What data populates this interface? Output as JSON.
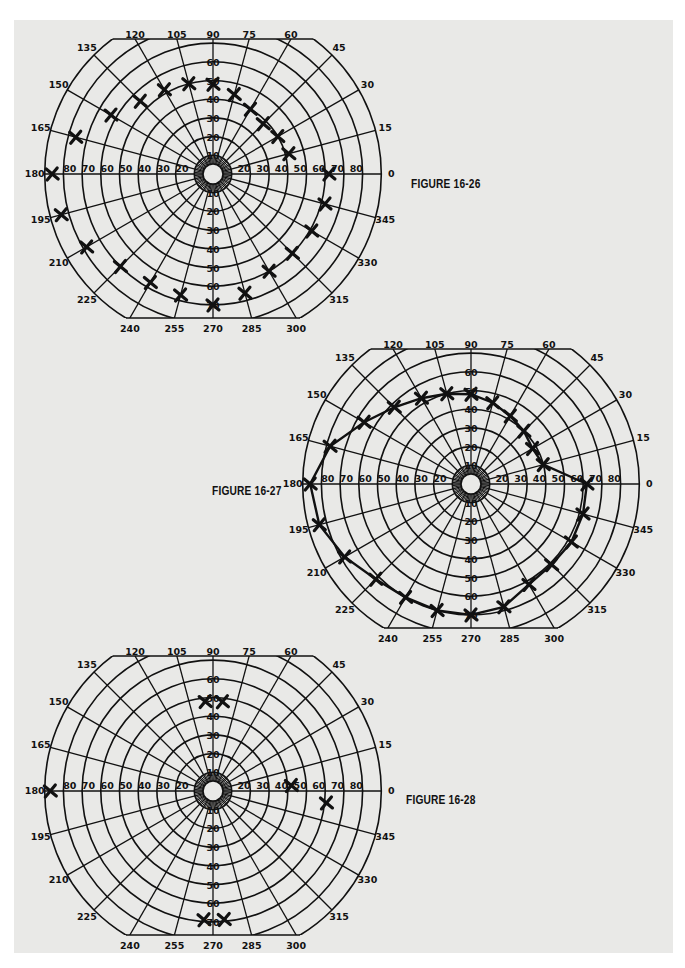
{
  "page": {
    "background": "#e9e9e7",
    "ink": "#111111"
  },
  "chart_data": [
    {
      "type": "scatter",
      "title": "FIGURE 16-26",
      "polar": true,
      "angular_ticks": [
        0,
        15,
        30,
        45,
        60,
        75,
        90,
        105,
        120,
        135,
        150,
        165,
        180,
        195,
        210,
        225,
        240,
        255,
        270,
        285,
        300,
        315,
        330,
        345
      ],
      "radial_ticks": [
        10,
        20,
        30,
        40,
        50,
        60,
        70,
        80,
        90
      ],
      "radial_labels_right": [
        "20",
        "30",
        "40",
        "50",
        "60",
        "70",
        "80"
      ],
      "radial_labels_left": [
        "20",
        "30",
        "40",
        "50",
        "60",
        "70",
        "80"
      ],
      "radial_labels_up": [
        "10",
        "20",
        "30",
        "40",
        "50",
        "60"
      ],
      "radial_labels_down": [
        "10",
        "20",
        "30",
        "40",
        "50",
        "60",
        "70"
      ],
      "connected": false,
      "points": [
        {
          "angle": 0,
          "r": 62
        },
        {
          "angle": 15,
          "r": 42
        },
        {
          "angle": 30,
          "r": 40
        },
        {
          "angle": 45,
          "r": 38
        },
        {
          "angle": 60,
          "r": 40
        },
        {
          "angle": 75,
          "r": 44
        },
        {
          "angle": 90,
          "r": 48
        },
        {
          "angle": 105,
          "r": 50
        },
        {
          "angle": 120,
          "r": 52
        },
        {
          "angle": 135,
          "r": 55
        },
        {
          "angle": 150,
          "r": 63
        },
        {
          "angle": 165,
          "r": 76
        },
        {
          "angle": 180,
          "r": 86
        },
        {
          "angle": 195,
          "r": 84
        },
        {
          "angle": 210,
          "r": 78
        },
        {
          "angle": 225,
          "r": 70
        },
        {
          "angle": 240,
          "r": 67
        },
        {
          "angle": 255,
          "r": 67
        },
        {
          "angle": 270,
          "r": 70
        },
        {
          "angle": 285,
          "r": 66
        },
        {
          "angle": 300,
          "r": 60
        },
        {
          "angle": 315,
          "r": 60
        },
        {
          "angle": 330,
          "r": 61
        },
        {
          "angle": 345,
          "r": 62
        }
      ]
    },
    {
      "type": "line",
      "title": "FIGURE 16-27",
      "polar": true,
      "angular_ticks": [
        0,
        15,
        30,
        45,
        60,
        75,
        90,
        105,
        120,
        135,
        150,
        165,
        180,
        195,
        210,
        225,
        240,
        255,
        270,
        285,
        300,
        315,
        330,
        345
      ],
      "radial_ticks": [
        10,
        20,
        30,
        40,
        50,
        60,
        70,
        80,
        90
      ],
      "connected": true,
      "points": [
        {
          "angle": 0,
          "r": 62
        },
        {
          "angle": 15,
          "r": 40
        },
        {
          "angle": 30,
          "r": 38
        },
        {
          "angle": 45,
          "r": 40
        },
        {
          "angle": 60,
          "r": 42
        },
        {
          "angle": 75,
          "r": 45
        },
        {
          "angle": 90,
          "r": 48
        },
        {
          "angle": 105,
          "r": 50
        },
        {
          "angle": 120,
          "r": 53
        },
        {
          "angle": 135,
          "r": 58
        },
        {
          "angle": 150,
          "r": 66
        },
        {
          "angle": 165,
          "r": 78
        },
        {
          "angle": 180,
          "r": 86
        },
        {
          "angle": 195,
          "r": 84
        },
        {
          "angle": 210,
          "r": 78
        },
        {
          "angle": 225,
          "r": 72
        },
        {
          "angle": 240,
          "r": 70
        },
        {
          "angle": 255,
          "r": 70
        },
        {
          "angle": 270,
          "r": 70
        },
        {
          "angle": 285,
          "r": 68
        },
        {
          "angle": 300,
          "r": 62
        },
        {
          "angle": 315,
          "r": 61
        },
        {
          "angle": 330,
          "r": 62
        },
        {
          "angle": 345,
          "r": 62
        }
      ]
    },
    {
      "type": "scatter",
      "title": "FIGURE 16-28",
      "polar": true,
      "angular_ticks": [
        0,
        15,
        30,
        45,
        60,
        75,
        90,
        105,
        120,
        135,
        150,
        165,
        180,
        195,
        210,
        225,
        240,
        255,
        270,
        285,
        300,
        315,
        330,
        345
      ],
      "radial_ticks": [
        10,
        20,
        30,
        40,
        50,
        60,
        70,
        80,
        90
      ],
      "connected": false,
      "points": [
        {
          "angle": 95,
          "r": 48
        },
        {
          "angle": 84,
          "r": 48
        },
        {
          "angle": 180,
          "r": 87
        },
        {
          "angle": 4,
          "r": 42
        },
        {
          "angle": 354,
          "r": 61
        },
        {
          "angle": 266,
          "r": 69
        },
        {
          "angle": 275,
          "r": 69
        }
      ]
    }
  ],
  "figures": [
    {
      "label": "FIGURE 16-26"
    },
    {
      "label": "FIGURE 16-27"
    },
    {
      "label": "FIGURE 16-28"
    }
  ]
}
